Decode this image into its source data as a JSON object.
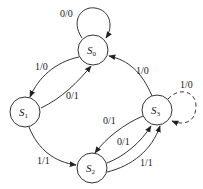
{
  "diagram": {
    "type": "state-machine",
    "states": [
      {
        "id": "S0",
        "name": "S",
        "sub": "0"
      },
      {
        "id": "S1",
        "name": "S",
        "sub": "1"
      },
      {
        "id": "S2",
        "name": "S",
        "sub": "2"
      },
      {
        "id": "S3",
        "name": "S",
        "sub": "3"
      }
    ],
    "transitions": [
      {
        "from": "S0",
        "to": "S0",
        "label": "0/0",
        "style": "solid"
      },
      {
        "from": "S0",
        "to": "S1",
        "label": "1/0",
        "style": "solid"
      },
      {
        "from": "S1",
        "to": "S0",
        "label": "0/1",
        "style": "solid"
      },
      {
        "from": "S1",
        "to": "S2",
        "label": "1/1",
        "style": "solid"
      },
      {
        "from": "S3",
        "to": "S0",
        "label": "1/0",
        "style": "solid"
      },
      {
        "from": "S3",
        "to": "S2",
        "label": "0/1",
        "style": "solid"
      },
      {
        "from": "S2",
        "to": "S3",
        "label": "0/1",
        "style": "solid"
      },
      {
        "from": "S2",
        "to": "S3",
        "label": "1/1",
        "style": "solid"
      },
      {
        "from": "S3",
        "to": "S3",
        "label": "1/0",
        "style": "dashed"
      }
    ]
  }
}
